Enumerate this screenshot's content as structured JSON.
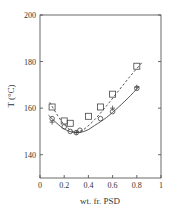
{
  "chart_data": {
    "type": "scatter",
    "title": "",
    "xlabel": "wt. fr. PSD",
    "ylabel": "T (°C)",
    "xlim": [
      0,
      1
    ],
    "ylim": [
      130,
      200
    ],
    "xticks": [
      0,
      0.2,
      0.4,
      0.6,
      0.8,
      1
    ],
    "xtick_labels": [
      "0",
      "0.2",
      "0.4",
      "0.6",
      "0.8",
      "1"
    ],
    "yticks": [
      140,
      160,
      180,
      200
    ],
    "ytick_labels": [
      "140",
      "160",
      "180",
      "200"
    ],
    "grid": false,
    "legend": null,
    "series": [
      {
        "name": "squares",
        "marker": "square",
        "x": [
          0.1,
          0.2,
          0.25,
          0.4,
          0.5,
          0.6,
          0.8
        ],
        "y": [
          160.5,
          154.5,
          153.5,
          156.5,
          160.5,
          166,
          178
        ]
      },
      {
        "name": "circles",
        "marker": "circle",
        "x": [
          0.1,
          0.2,
          0.25,
          0.3,
          0.33,
          0.5,
          0.6,
          0.8
        ],
        "y": [
          155.5,
          152,
          150,
          149.5,
          150.5,
          155.5,
          158.5,
          168.5
        ]
      },
      {
        "name": "plus",
        "marker": "plus",
        "x": [
          0.1,
          0.3,
          0.6,
          0.8
        ],
        "y": [
          154,
          149.5,
          160,
          169
        ]
      },
      {
        "name": "fit-dashed",
        "line": "dashed",
        "x": [
          0.08,
          0.15,
          0.2,
          0.27,
          0.35,
          0.45,
          0.55,
          0.65,
          0.75,
          0.85
        ],
        "y": [
          162.5,
          156.5,
          153,
          150,
          150.5,
          155,
          161,
          167.5,
          174,
          180
        ]
      },
      {
        "name": "fit-solid",
        "line": "solid",
        "x": [
          0.07,
          0.15,
          0.22,
          0.3,
          0.38,
          0.45,
          0.55,
          0.65,
          0.75,
          0.82
        ],
        "y": [
          157,
          153,
          150.5,
          149.5,
          150.3,
          152.5,
          156,
          160.5,
          165.5,
          169.5
        ]
      }
    ]
  }
}
